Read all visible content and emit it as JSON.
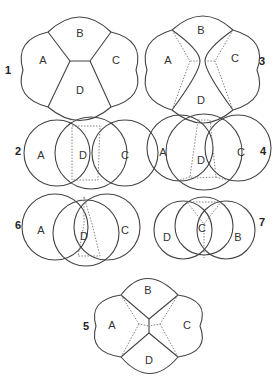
{
  "diagrams": [
    {
      "id": "1",
      "number": "1",
      "labels": {
        "A": "A",
        "B": "B",
        "C": "C",
        "D": "D"
      }
    },
    {
      "id": "3",
      "number": "3",
      "labels": {
        "A": "A",
        "B": "B",
        "C": "C",
        "D": "D"
      }
    },
    {
      "id": "2",
      "number": "2",
      "labels": {
        "A": "A",
        "D": "D",
        "C": "C"
      }
    },
    {
      "id": "4",
      "number": "4",
      "labels": {
        "A": "A",
        "D": "D",
        "C": "C"
      }
    },
    {
      "id": "6",
      "number": "6",
      "labels": {
        "A": "A",
        "D": "D",
        "C": "C"
      }
    },
    {
      "id": "7",
      "number": "7",
      "labels": {
        "D": "D",
        "C": "C",
        "B": "B"
      }
    },
    {
      "id": "5",
      "number": "5",
      "labels": {
        "A": "A",
        "B": "B",
        "C": "C",
        "D": "D"
      }
    }
  ]
}
